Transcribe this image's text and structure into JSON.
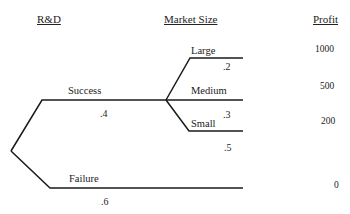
{
  "headers": {
    "rd": "R&D",
    "market_size": "Market Size",
    "profit": "Profit"
  },
  "rd_branches": [
    {
      "label": "Success",
      "probability": ".4"
    },
    {
      "label": "Failure",
      "probability": ".6"
    }
  ],
  "market_branches": [
    {
      "label": "Large",
      "probability": ".2",
      "profit": "1000"
    },
    {
      "label": "Medium",
      "probability": ".3",
      "profit": "500"
    },
    {
      "label": "Small",
      "probability": ".5",
      "profit": "200"
    }
  ],
  "failure_profit": "0",
  "colors": {
    "line": "#1a1a1a",
    "text": "#222222"
  }
}
